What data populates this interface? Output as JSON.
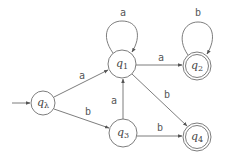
{
  "diagram": {
    "type": "finite-automaton",
    "start_state": "q_lambda",
    "states": [
      {
        "id": "q_lambda",
        "name": "q",
        "sub": "λ",
        "x": 43,
        "y": 103,
        "r": 12,
        "accepting": false,
        "start": true
      },
      {
        "id": "q1",
        "name": "q",
        "sub": "1",
        "x": 122,
        "y": 64,
        "r": 14,
        "accepting": false,
        "start": false
      },
      {
        "id": "q2",
        "name": "q",
        "sub": "2",
        "x": 197,
        "y": 66,
        "r": 14,
        "accepting": true,
        "start": false
      },
      {
        "id": "q3",
        "name": "q",
        "sub": "3",
        "x": 123,
        "y": 133,
        "r": 14,
        "accepting": false,
        "start": false
      },
      {
        "id": "q4",
        "name": "q",
        "sub": "4",
        "x": 197,
        "y": 137,
        "r": 14,
        "accepting": true,
        "start": false
      }
    ],
    "transitions": [
      {
        "from": "q_lambda",
        "to": "q1",
        "symbol": "a"
      },
      {
        "from": "q_lambda",
        "to": "q3",
        "symbol": "b"
      },
      {
        "from": "q1",
        "to": "q1",
        "symbol": "a"
      },
      {
        "from": "q1",
        "to": "q2",
        "symbol": "a"
      },
      {
        "from": "q1",
        "to": "q4",
        "symbol": "b"
      },
      {
        "from": "q2",
        "to": "q2",
        "symbol": "b"
      },
      {
        "from": "q3",
        "to": "q1",
        "symbol": "a"
      },
      {
        "from": "q3",
        "to": "q4",
        "symbol": "b"
      }
    ],
    "labels": {
      "q_lambda": {
        "name": "q",
        "sub": "λ"
      },
      "q1": {
        "name": "q",
        "sub": "1"
      },
      "q2": {
        "name": "q",
        "sub": "2"
      },
      "q3": {
        "name": "q",
        "sub": "3"
      },
      "q4": {
        "name": "q",
        "sub": "4"
      },
      "e_qlambda_q1": "a",
      "e_qlambda_q3": "b",
      "e_q1_loop": "a",
      "e_q1_q2": "a",
      "e_q1_q4": "b",
      "e_q2_loop": "b",
      "e_q3_q1": "a",
      "e_q3_q4": "b"
    },
    "colors": {
      "stroke": "#6e6e6e",
      "text": "#444444",
      "background": "#ffffff"
    }
  }
}
